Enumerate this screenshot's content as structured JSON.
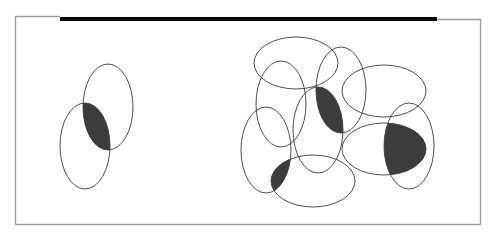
{
  "figure": {
    "colors": {
      "background": "#ffffff",
      "outline": "#3a3a3a",
      "shade": "#3c3c3c",
      "frame": "#9a9a9a",
      "bar": "#050505"
    },
    "groups": [
      {
        "name": "left-pair",
        "ellipses": [
          "L1",
          "L2"
        ],
        "shaded_overlaps": [
          [
            "L1",
            "L2"
          ]
        ]
      },
      {
        "name": "right-cluster",
        "ellipses": [
          "R1",
          "R2",
          "R3",
          "R4",
          "R5",
          "R6",
          "R7",
          "R8",
          "R9"
        ],
        "shaded_overlaps": [
          [
            "R4",
            "R5"
          ],
          [
            "R3",
            "R6"
          ],
          [
            "R8",
            "R9"
          ]
        ]
      }
    ]
  }
}
